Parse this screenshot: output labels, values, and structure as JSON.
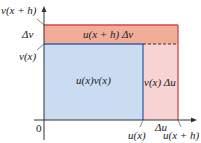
{
  "diagram": {
    "colors": {
      "blue_fill": "#c9dcf2",
      "blue_edge": "#3b63a8",
      "orange_fill": "#f2ad98",
      "pink_fill": "#f7d3d3",
      "red_edge": "#d8444a",
      "axis": "#333333"
    },
    "y_axis_labels": {
      "top": "v(x + h)",
      "delta": "Δv",
      "bottom": "v(x)"
    },
    "x_axis_labels": {
      "origin": "0",
      "left": "u(x)",
      "delta": "Δu",
      "right": "u(x + h)"
    },
    "regions": {
      "main": "u(x)v(x)",
      "top_strip": "u(x + h) Δv",
      "right_strip": "v(x) Δu"
    }
  }
}
